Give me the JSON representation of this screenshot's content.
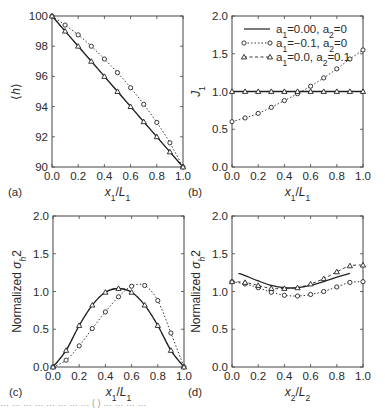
{
  "figure": {
    "caption_fragment": "… … … … … … … … ( ) … … … …"
  },
  "chart_data": [
    {
      "panel": "(a)",
      "type": "line",
      "title": "",
      "xlabel": "x1/L1",
      "ylabel": "⟨h⟩",
      "xlim": [
        0.0,
        1.0
      ],
      "ylim": [
        90,
        100
      ],
      "xticks": [
        "0.0",
        "0.2",
        "0.4",
        "0.6",
        "0.8",
        "1.0"
      ],
      "yticks": [
        "90",
        "92",
        "94",
        "96",
        "98",
        "100"
      ],
      "grid": false,
      "x": [
        0.0,
        0.1,
        0.2,
        0.3,
        0.4,
        0.5,
        0.6,
        0.7,
        0.8,
        0.9,
        1.0
      ],
      "series": [
        {
          "name": "a1=0.00, a2=0",
          "style": "solid",
          "marker": "none",
          "values": [
            100,
            99,
            98,
            97,
            96,
            95,
            94,
            93,
            92,
            91,
            90
          ]
        },
        {
          "name": "a1=-0.1, a2=0",
          "style": "dotted",
          "marker": "circle",
          "values": [
            100,
            99.4,
            98.75,
            98.0,
            97.15,
            96.25,
            95.25,
            94.15,
            92.95,
            91.6,
            90
          ]
        },
        {
          "name": "a1=0.0, a2=0.1",
          "style": "dashed",
          "marker": "triangle",
          "values": [
            100,
            99,
            98,
            97,
            96,
            95,
            94,
            93,
            92,
            91,
            90
          ]
        }
      ]
    },
    {
      "panel": "(b)",
      "type": "line",
      "title": "",
      "xlabel": "x1/L1",
      "ylabel": "J1",
      "xlim": [
        0.0,
        1.0
      ],
      "ylim": [
        0.0,
        2.0
      ],
      "xticks": [
        "0.0",
        "0.2",
        "0.4",
        "0.6",
        "0.8",
        "1.0"
      ],
      "yticks": [
        "0.0",
        "0.5",
        "1.0",
        "1.5",
        "2.0"
      ],
      "grid": false,
      "legend_position": "upper right",
      "x": [
        0.0,
        0.1,
        0.2,
        0.3,
        0.4,
        0.5,
        0.6,
        0.7,
        0.8,
        0.9,
        1.0
      ],
      "series": [
        {
          "name": "a1=0.00, a2=0",
          "style": "solid",
          "marker": "none",
          "values": [
            1.0,
            1.0,
            1.0,
            1.0,
            1.0,
            1.0,
            1.0,
            1.0,
            1.0,
            1.0,
            1.0
          ]
        },
        {
          "name": "a1=-0.1, a2=0",
          "style": "dotted",
          "marker": "circle",
          "values": [
            0.6,
            0.65,
            0.71,
            0.79,
            0.88,
            0.97,
            1.07,
            1.18,
            1.3,
            1.43,
            1.55
          ]
        },
        {
          "name": "a1=0.0, a2=0.1",
          "style": "dashed",
          "marker": "triangle",
          "values": [
            1.0,
            1.0,
            1.0,
            1.0,
            1.0,
            1.0,
            1.0,
            1.0,
            1.0,
            1.0,
            1.0
          ]
        }
      ]
    },
    {
      "panel": "(c)",
      "type": "line",
      "title": "",
      "xlabel": "x1/L1",
      "ylabel": "Normalized σh²",
      "xlim": [
        0.0,
        1.0
      ],
      "ylim": [
        0.0,
        2.0
      ],
      "xticks": [
        "0.0",
        "0.2",
        "0.4",
        "0.6",
        "0.8",
        "1.0"
      ],
      "yticks": [
        "0.0",
        "0.5",
        "1.0",
        "1.5",
        "2.0"
      ],
      "grid": false,
      "x": [
        0.0,
        0.1,
        0.2,
        0.3,
        0.4,
        0.5,
        0.6,
        0.7,
        0.8,
        0.9,
        1.0
      ],
      "series": [
        {
          "name": "a1=0.00, a2=0",
          "style": "solid",
          "marker": "none",
          "values": [
            0.0,
            0.22,
            0.55,
            0.82,
            0.99,
            1.04,
            0.99,
            0.82,
            0.55,
            0.22,
            0.0
          ]
        },
        {
          "name": "a1=-0.1, a2=0",
          "style": "dotted",
          "marker": "circle",
          "values": [
            0.0,
            0.09,
            0.28,
            0.51,
            0.73,
            0.93,
            1.07,
            1.08,
            0.88,
            0.45,
            0.0
          ]
        },
        {
          "name": "a1=0.0, a2=0.1",
          "style": "dashed",
          "marker": "triangle",
          "values": [
            0.0,
            0.22,
            0.55,
            0.82,
            0.99,
            1.04,
            0.99,
            0.82,
            0.55,
            0.22,
            0.0
          ]
        }
      ]
    },
    {
      "panel": "(d)",
      "type": "line",
      "title": "",
      "xlabel": "x2/L2",
      "ylabel": "Normalized σh²",
      "xlim": [
        0.0,
        1.0
      ],
      "ylim": [
        0.0,
        2.0
      ],
      "xticks": [
        "0.0",
        "0.2",
        "0.4",
        "0.6",
        "0.8",
        "1.0"
      ],
      "yticks": [
        "0.0",
        "0.5",
        "1.0",
        "1.5",
        "2.0"
      ],
      "grid": false,
      "series": [
        {
          "name": "a1=0.00, a2=0",
          "style": "solid",
          "marker": "none",
          "x": [
            0.05,
            0.1,
            0.2,
            0.3,
            0.4,
            0.5,
            0.6,
            0.7,
            0.8,
            0.9
          ],
          "values": [
            1.24,
            1.21,
            1.14,
            1.08,
            1.05,
            1.05,
            1.08,
            1.13,
            1.19,
            1.24
          ]
        },
        {
          "name": "a1=-0.1, a2=0",
          "style": "dotted",
          "marker": "circle",
          "x": [
            0.0,
            0.1,
            0.2,
            0.3,
            0.4,
            0.5,
            0.6,
            0.7,
            0.8,
            0.9,
            1.0
          ],
          "values": [
            1.13,
            1.1,
            1.05,
            0.99,
            0.95,
            0.94,
            0.96,
            1.0,
            1.06,
            1.12,
            1.13
          ]
        },
        {
          "name": "a1=0.0, a2=0.1",
          "style": "dashed",
          "marker": "triangle",
          "x": [
            0.0,
            0.1,
            0.2,
            0.3,
            0.4,
            0.5,
            0.6,
            0.7,
            0.8,
            0.9,
            1.0
          ],
          "values": [
            1.13,
            1.12,
            1.08,
            1.04,
            1.04,
            1.05,
            1.1,
            1.17,
            1.26,
            1.34,
            1.35
          ]
        }
      ]
    }
  ],
  "legend": {
    "entries": [
      {
        "main": "a",
        "sub1": "1",
        "t1": "=0.00, a",
        "sub2": "2",
        "t2": "=0"
      },
      {
        "main": "a",
        "sub1": "1",
        "t1": "=−0.1, a",
        "sub2": "2",
        "t2": "=0"
      },
      {
        "main": "a",
        "sub1": "1",
        "t1": "=0.0, a",
        "sub2": "2",
        "t2": "=0.1"
      }
    ]
  },
  "panels_layout": [
    {
      "left": 52,
      "top": 16,
      "right": 183,
      "bottom": 167
    },
    {
      "left": 232,
      "top": 16,
      "right": 363,
      "bottom": 167
    },
    {
      "left": 53,
      "top": 216,
      "right": 184,
      "bottom": 367
    },
    {
      "left": 232,
      "top": 216,
      "right": 363,
      "bottom": 367
    }
  ],
  "colors": {
    "line": "#222222",
    "frame": "#444444",
    "marker_fill": "#ffffff"
  }
}
